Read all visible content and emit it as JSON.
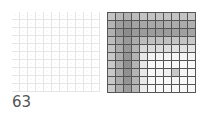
{
  "label": "63",
  "left_grid": {
    "rows": 10,
    "cols": 11,
    "cell_glyph": "·"
  },
  "right_grid": {
    "rows": 10,
    "cols": 11,
    "shades": [
      [
        "#c4c4c4",
        "#b8b8b8",
        "#b0b0b0",
        "#bcbcbc",
        "#c4c4c4",
        "#c4c4c4",
        "#c4c4c4",
        "#c4c4c4",
        "#c4c4c4",
        "#c4c4c4",
        "#c8c8c8"
      ],
      [
        "#b4b4b4",
        "#a0a0a0",
        "#989898",
        "#a4a4a4",
        "#a8a8a8",
        "#a8a8a8",
        "#a8a8a8",
        "#acacac",
        "#acacac",
        "#acacac",
        "#b0b0b0"
      ],
      [
        "#b0b0b0",
        "#989898",
        "#8c8c8c",
        "#9a9a9a",
        "#9c9c9c",
        "#9c9c9c",
        "#9c9c9c",
        "#9c9c9c",
        "#a0a0a0",
        "#a0a0a0",
        "#a4a4a4"
      ],
      [
        "#bcbcbc",
        "#a8a8a8",
        "#9a9a9a",
        "#acacac",
        "#bcbcbc",
        "#c0c0c0",
        "#c0c0c0",
        "#c0c0c0",
        "#c4c4c4",
        "#c4c4c4",
        "#c8c8c8"
      ],
      [
        "#c4c4c4",
        "#acacac",
        "#989898",
        "#b4b4b4",
        "#d8d8d8",
        "#dcdcdc",
        "#dcdcdc",
        "#dcdcdc",
        "#e0e0e0",
        "#e0e0e0",
        "#e4e4e4"
      ],
      [
        "#c8c8c8",
        "#acacac",
        "#949494",
        "#b4b4b4",
        "#e8e8e8",
        "#f4f4f4",
        "#f4f4f4",
        "#f4f4f4",
        "#f4f4f4",
        "#f4f4f4",
        "#f4f4f4"
      ],
      [
        "#c8c8c8",
        "#acacac",
        "#909090",
        "#b4b4b4",
        "#e8e8e8",
        "#f8f8f8",
        "#f8f8f8",
        "#f8f8f8",
        "#f8f8f8",
        "#f8f8f8",
        "#f8f8f8"
      ],
      [
        "#c8c8c8",
        "#acacac",
        "#909090",
        "#b4b4b4",
        "#e8e8e8",
        "#f8f8f8",
        "#f4f4f4",
        "#f0f0f0",
        "#c8c8c8",
        "#f4f4f4",
        "#f8f8f8"
      ],
      [
        "#c8c8c8",
        "#acacac",
        "#949494",
        "#b4b4b4",
        "#e8e8e8",
        "#f8f8f8",
        "#f8f8f8",
        "#f8f8f8",
        "#f4f4f4",
        "#f8f8f8",
        "#f8f8f8"
      ],
      [
        "#cccccc",
        "#b0b0b0",
        "#9c9c9c",
        "#b8b8b8",
        "#ececec",
        "#f8f8f8",
        "#f8f8f8",
        "#f8f8f8",
        "#f8f8f8",
        "#f8f8f8",
        "#f8f8f8"
      ]
    ]
  }
}
